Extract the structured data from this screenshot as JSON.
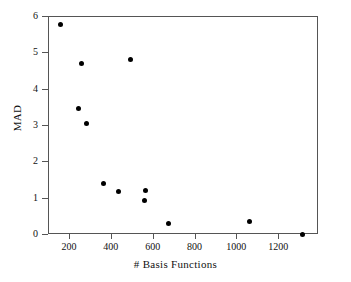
{
  "chart_data": {
    "type": "scatter",
    "title": "",
    "xlabel": "# Basis Functions",
    "ylabel": "MAD",
    "xlim": [
      100,
      1390
    ],
    "ylim": [
      0,
      6
    ],
    "xticks": [
      200,
      400,
      600,
      800,
      1000,
      1200
    ],
    "xtick_labels": [
      "200",
      "400",
      "600",
      "800",
      "1000",
      "1200"
    ],
    "yticks": [
      0,
      1,
      2,
      3,
      4,
      5,
      6
    ],
    "ytick_labels": [
      "0",
      "1",
      "2",
      "3",
      "4",
      "5",
      "6"
    ],
    "grid": false,
    "legend": null,
    "marker": "filled-circle",
    "marker_color": "#000000",
    "points": [
      {
        "x": 157,
        "y": 5.78
      },
      {
        "x": 257,
        "y": 4.72
      },
      {
        "x": 490,
        "y": 4.83
      },
      {
        "x": 243,
        "y": 3.47
      },
      {
        "x": 281,
        "y": 3.06
      },
      {
        "x": 362,
        "y": 1.42
      },
      {
        "x": 433,
        "y": 1.19
      },
      {
        "x": 562,
        "y": 1.22
      },
      {
        "x": 557,
        "y": 0.94
      },
      {
        "x": 671,
        "y": 0.33
      },
      {
        "x": 1057,
        "y": 0.36
      },
      {
        "x": 1310,
        "y": 0.02
      }
    ]
  },
  "axes": {
    "x_axis_name": "# Basis Functions",
    "y_axis_name": "MAD"
  }
}
